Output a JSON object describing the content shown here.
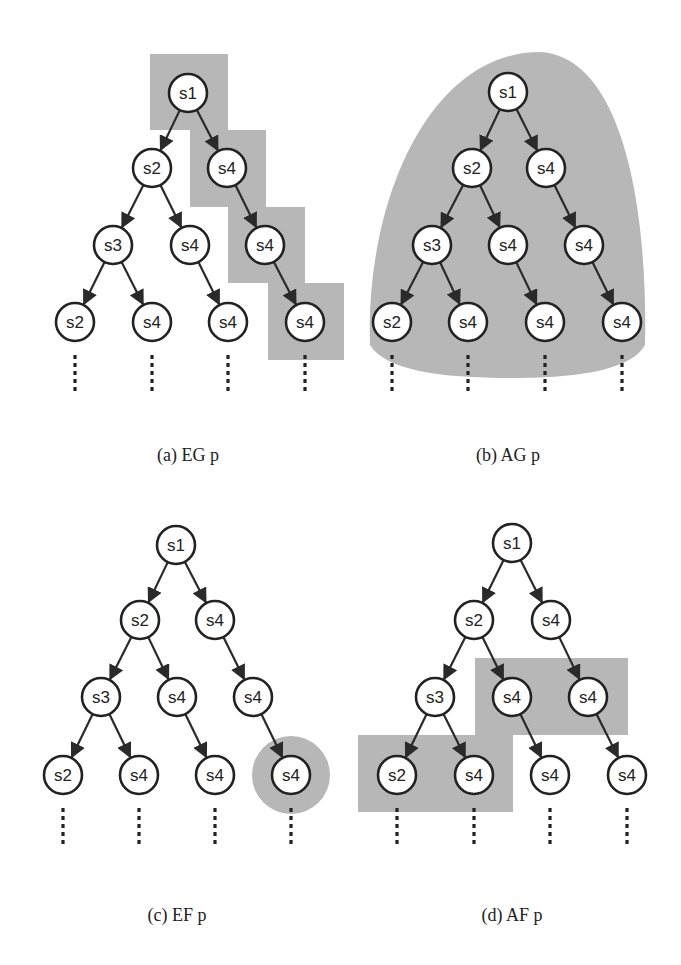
{
  "figure": {
    "node_radius": 19,
    "colors": {
      "shade": "#b7b7b7",
      "node_fill": "#ffffff",
      "node_stroke": "#222222",
      "edge": "#2a2a2a",
      "background": "#ffffff"
    },
    "panels": [
      {
        "id": "a",
        "caption": "(a) EG p",
        "caption_pos": [
          188,
          455
        ],
        "nodes": [
          {
            "label": "s1",
            "x": 188,
            "y": 93
          },
          {
            "label": "s2",
            "x": 152,
            "y": 168
          },
          {
            "label": "s4",
            "x": 227,
            "y": 168
          },
          {
            "label": "s3",
            "x": 113,
            "y": 245
          },
          {
            "label": "s4",
            "x": 190,
            "y": 245
          },
          {
            "label": "s4",
            "x": 265,
            "y": 245
          },
          {
            "label": "s2",
            "x": 75,
            "y": 322
          },
          {
            "label": "s4",
            "x": 152,
            "y": 322
          },
          {
            "label": "s4",
            "x": 228,
            "y": 322
          },
          {
            "label": "s4",
            "x": 305,
            "y": 322
          }
        ],
        "edges": [
          [
            0,
            1
          ],
          [
            0,
            2
          ],
          [
            1,
            3
          ],
          [
            1,
            4
          ],
          [
            2,
            5
          ],
          [
            3,
            6
          ],
          [
            3,
            7
          ],
          [
            4,
            8
          ],
          [
            5,
            9
          ]
        ],
        "shading": {
          "type": "rects",
          "rects": [
            [
              150,
              54,
              78,
              76
            ],
            [
              190,
              130,
              76,
              77
            ],
            [
              228,
              207,
              77,
              76
            ],
            [
              268,
              283,
              76,
              77
            ]
          ]
        }
      },
      {
        "id": "b",
        "caption": "(b) AG p",
        "caption_pos": [
          508,
          455
        ],
        "nodes": [
          {
            "label": "s1",
            "x": 508,
            "y": 92
          },
          {
            "label": "s2",
            "x": 472,
            "y": 168
          },
          {
            "label": "s4",
            "x": 546,
            "y": 168
          },
          {
            "label": "s3",
            "x": 432,
            "y": 245
          },
          {
            "label": "s4",
            "x": 508,
            "y": 245
          },
          {
            "label": "s4",
            "x": 584,
            "y": 245
          },
          {
            "label": "s2",
            "x": 392,
            "y": 322
          },
          {
            "label": "s4",
            "x": 468,
            "y": 322
          },
          {
            "label": "s4",
            "x": 545,
            "y": 322
          },
          {
            "label": "s4",
            "x": 622,
            "y": 322
          }
        ],
        "edges": [
          [
            0,
            1
          ],
          [
            0,
            2
          ],
          [
            1,
            3
          ],
          [
            1,
            4
          ],
          [
            2,
            5
          ],
          [
            3,
            6
          ],
          [
            3,
            7
          ],
          [
            4,
            8
          ],
          [
            5,
            9
          ]
        ],
        "shading": {
          "type": "dome",
          "path": "M 370 345 C 365 200, 430 52, 540 52 C 620 56, 648 200, 645 345 C 630 372, 570 378, 510 378 C 440 378, 385 370, 370 345 Z"
        }
      },
      {
        "id": "c",
        "caption": "(c) EF p",
        "caption_pos": [
          177,
          915
        ],
        "nodes": [
          {
            "label": "s1",
            "x": 176,
            "y": 545
          },
          {
            "label": "s2",
            "x": 140,
            "y": 620
          },
          {
            "label": "s4",
            "x": 215,
            "y": 620
          },
          {
            "label": "s3",
            "x": 101,
            "y": 697
          },
          {
            "label": "s4",
            "x": 177,
            "y": 697
          },
          {
            "label": "s4",
            "x": 253,
            "y": 697
          },
          {
            "label": "s2",
            "x": 63,
            "y": 775
          },
          {
            "label": "s4",
            "x": 139,
            "y": 775
          },
          {
            "label": "s4",
            "x": 215,
            "y": 775
          },
          {
            "label": "s4",
            "x": 291,
            "y": 775
          }
        ],
        "edges": [
          [
            0,
            1
          ],
          [
            0,
            2
          ],
          [
            1,
            3
          ],
          [
            1,
            4
          ],
          [
            2,
            5
          ],
          [
            3,
            6
          ],
          [
            3,
            7
          ],
          [
            4,
            8
          ],
          [
            5,
            9
          ]
        ],
        "shading": {
          "type": "circle",
          "cx": 291,
          "cy": 775,
          "r": 39
        }
      },
      {
        "id": "d",
        "caption": "(d) AF p",
        "caption_pos": [
          512,
          915
        ],
        "nodes": [
          {
            "label": "s1",
            "x": 512,
            "y": 543
          },
          {
            "label": "s2",
            "x": 474,
            "y": 620
          },
          {
            "label": "s4",
            "x": 551,
            "y": 620
          },
          {
            "label": "s3",
            "x": 435,
            "y": 697
          },
          {
            "label": "s4",
            "x": 512,
            "y": 697
          },
          {
            "label": "s4",
            "x": 588,
            "y": 697
          },
          {
            "label": "s2",
            "x": 397,
            "y": 775
          },
          {
            "label": "s4",
            "x": 474,
            "y": 775
          },
          {
            "label": "s4",
            "x": 550,
            "y": 775
          },
          {
            "label": "s4",
            "x": 627,
            "y": 775
          }
        ],
        "edges": [
          [
            0,
            1
          ],
          [
            0,
            2
          ],
          [
            1,
            3
          ],
          [
            1,
            4
          ],
          [
            2,
            5
          ],
          [
            3,
            6
          ],
          [
            3,
            7
          ],
          [
            4,
            8
          ],
          [
            5,
            9
          ]
        ],
        "shading": {
          "type": "rects",
          "rects": [
            [
              475,
              658,
              153,
              77
            ],
            [
              358,
              735,
              155,
              77
            ]
          ]
        }
      }
    ],
    "bleed_text": [
      {
        "text": "is transformed to an equivalent one by unrolling the loops",
        "x": 340,
        "y": 20
      },
      {
        "text": "to the initial state and then an infinite tree of",
        "x": 340,
        "y": 40
      },
      {
        "text": "paths start from initial state",
        "x": 340,
        "y": 60
      }
    ]
  }
}
